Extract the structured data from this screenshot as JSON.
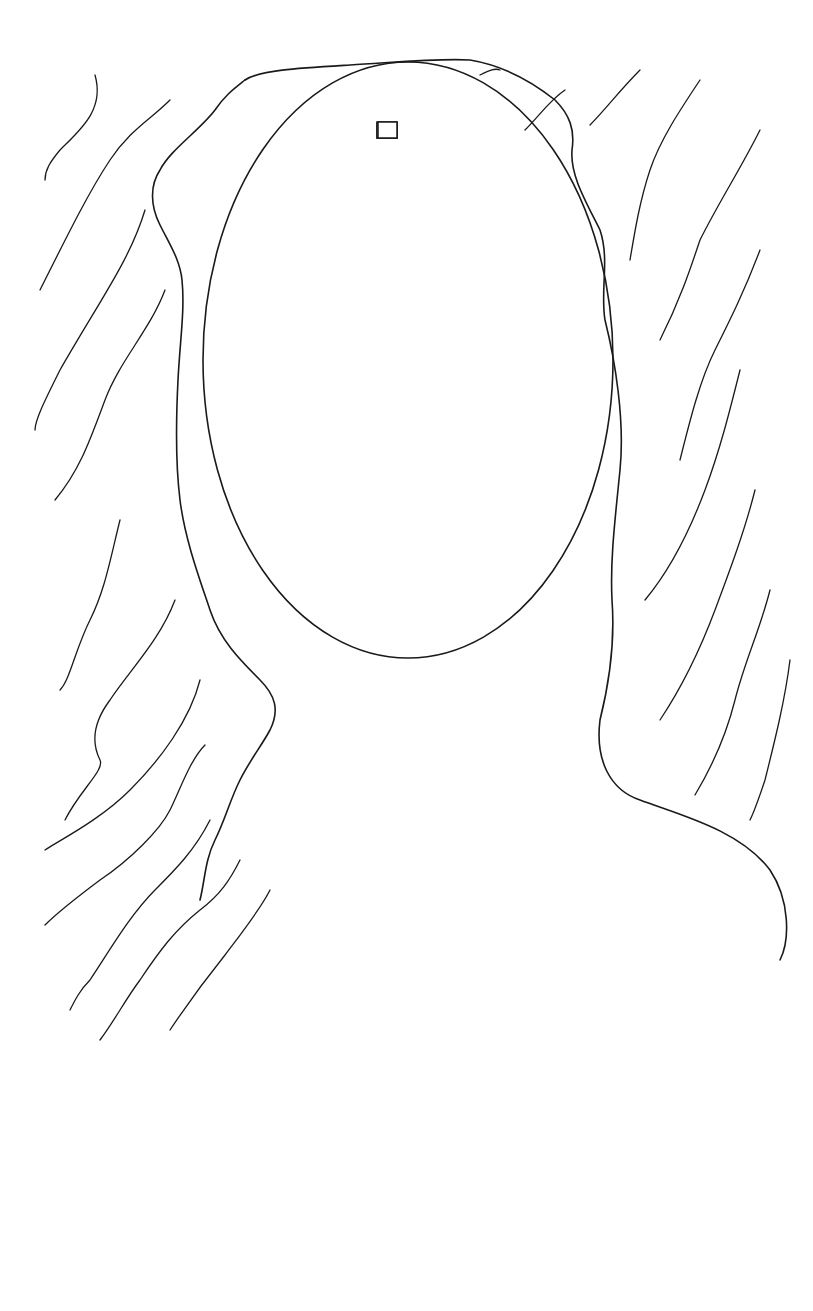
{
  "map": {
    "labels": {
      "dome": "Dome",
      "huts": "Huts",
      "cemetery": "Cemetery",
      "wing_a": "A",
      "wing_b": "B",
      "wing_c": "C",
      "wing_d": "D",
      "pond": "Pond",
      "trap": "Trap",
      "lab": "Lab",
      "dsu": "DSU",
      "sewage_1": "Sewage",
      "sewage_2": "Pools",
      "box_canyon": "Box Canyon",
      "tunnel": "Tunnel",
      "dormitory": "Dormitory",
      "receiving_1": "Receiving",
      "receiving_2": "Area",
      "access_road": "Access Road",
      "administrator_building": "Administrator Building"
    },
    "colors": {
      "ink": "#1a1a1a",
      "background": "#ffffff"
    }
  }
}
